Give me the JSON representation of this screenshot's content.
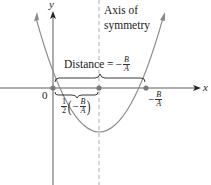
{
  "diagram": {
    "axes": {
      "x_label": "x",
      "y_label": "y",
      "origin_label": "0"
    },
    "annotations": {
      "axis_of_symmetry_line1": "Axis of",
      "axis_of_symmetry_line2": "symmetry",
      "distance_text": "Distance = ",
      "distance_sign": "−",
      "distance_num": "B",
      "distance_den": "A",
      "half_num": "1",
      "half_den": "2",
      "half_paren_open": "(",
      "half_sign": "−",
      "half_inner_num": "B",
      "half_inner_den": "A",
      "half_paren_close": ")",
      "root_sign": "−",
      "root_num": "B",
      "root_den": "A"
    },
    "points": [
      {
        "name": "origin",
        "x": 53,
        "y": 88
      },
      {
        "name": "vertex-x",
        "x": 99,
        "y": 88
      },
      {
        "name": "root",
        "x": 146,
        "y": 88
      }
    ],
    "colors": {
      "curve": "#8a8a8a",
      "axis": "#333333",
      "point": "#7a7a7a",
      "dashed": "#9a9a9a",
      "brace": "#222222",
      "text": "#222222"
    }
  }
}
